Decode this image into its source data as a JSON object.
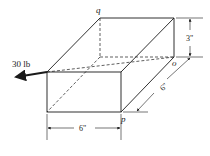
{
  "diagram": {
    "type": "isometric-box-force",
    "force": {
      "label": "30 lb",
      "direction": "from corner toward o, extended outward"
    },
    "points": {
      "q": "q",
      "o": "o",
      "p": "p"
    },
    "dimensions": {
      "height": "3\"",
      "depth": "6\"",
      "width": "6\""
    },
    "colors": {
      "line": "#1a1a1a",
      "background": "#ffffff"
    }
  }
}
